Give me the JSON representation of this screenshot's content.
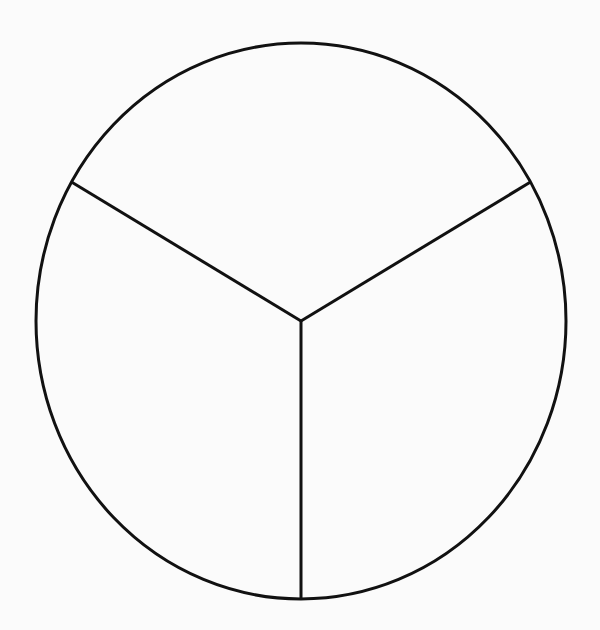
{
  "figure": {
    "name": "circle-divided-into-thirds",
    "canvas": {
      "width": 600,
      "height": 630
    },
    "background_color": "#fbfbfb",
    "stroke_color": "#111111",
    "stroke_width": 3,
    "fill_color": "none",
    "has_labels": false,
    "has_text": false,
    "has_shading": false
  },
  "chart_data": {
    "type": "pie",
    "title": "",
    "subtitle": "",
    "xlabel": "",
    "ylabel": "",
    "labels": [
      "",
      "",
      ""
    ],
    "values": [
      1,
      1,
      1
    ],
    "fractions": [
      "1/3",
      "1/3",
      "1/3"
    ],
    "percentages": [
      33.33,
      33.33,
      33.33
    ],
    "slice_angles_deg": [
      120,
      120,
      120
    ],
    "total_slices": 3,
    "shaded_slices": 0,
    "unshaded_slices": 3,
    "legend": [],
    "legend_position": "none",
    "grid": false,
    "annotations": [],
    "slice_colors": [
      "none",
      "none",
      "none"
    ],
    "outline_color": "#111111",
    "divider_color": "#111111",
    "geometry": {
      "center_x": 301,
      "center_y": 321,
      "radius_x": 265,
      "radius_y": 278,
      "radii_angles_deg": [
        90,
        210,
        330
      ],
      "start_angle_deg": 90,
      "direction": "clockwise"
    },
    "vertices": {
      "center": [
        301,
        321
      ],
      "bottom": [
        301,
        599
      ],
      "upper_left": [
        73,
        182
      ],
      "upper_right": [
        528,
        182
      ]
    }
  }
}
